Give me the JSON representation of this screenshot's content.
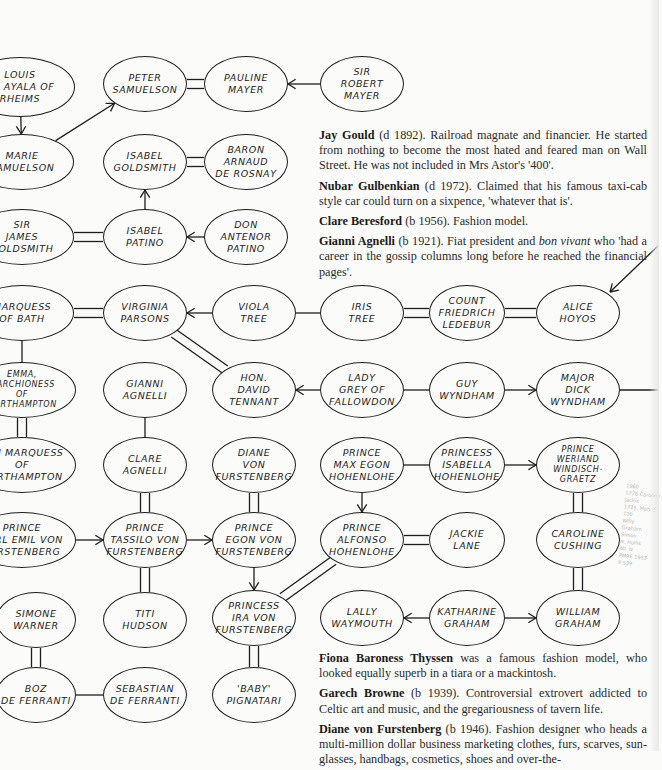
{
  "diagram": {
    "type": "family-relationship-chart",
    "legend_note": "double line = marriage; single line = relationship; arrow = child/descent",
    "nodes": [
      {
        "id": "louis",
        "label": "Louis\nde Ayala of\nRheims",
        "cx": 20,
        "cy": 87,
        "rx": 55,
        "ry": 30
      },
      {
        "id": "peter",
        "label": "Peter\nSamuelson",
        "cx": 145,
        "cy": 84,
        "rx": 42,
        "ry": 28
      },
      {
        "id": "pauline",
        "label": "Pauline\nMayer",
        "cx": 246,
        "cy": 84,
        "rx": 42,
        "ry": 28
      },
      {
        "id": "robert",
        "label": "Sir\nRobert\nMayer",
        "cx": 362,
        "cy": 84,
        "rx": 42,
        "ry": 28
      },
      {
        "id": "marie",
        "label": "Marie\nSamuelson",
        "cx": 22,
        "cy": 162,
        "rx": 52,
        "ry": 28
      },
      {
        "id": "isabelg",
        "label": "Isabel\nGoldsmith",
        "cx": 145,
        "cy": 162,
        "rx": 42,
        "ry": 28
      },
      {
        "id": "baron",
        "label": "Baron\nArnaud\nde Rosnay",
        "cx": 246,
        "cy": 162,
        "rx": 42,
        "ry": 28
      },
      {
        "id": "jamesg",
        "label": "Sir\nJames\nGoldsmith",
        "cx": 22,
        "cy": 237,
        "rx": 52,
        "ry": 28
      },
      {
        "id": "isabelp",
        "label": "Isabel\nPatino",
        "cx": 145,
        "cy": 237,
        "rx": 42,
        "ry": 28
      },
      {
        "id": "antenor",
        "label": "Don\nAntenor\nPatino",
        "cx": 246,
        "cy": 237,
        "rx": 42,
        "ry": 28
      },
      {
        "id": "bath",
        "label": "Marquess\nof Bath",
        "cx": 22,
        "cy": 313,
        "rx": 52,
        "ry": 28
      },
      {
        "id": "virginia",
        "label": "Virginia\nParsons",
        "cx": 145,
        "cy": 313,
        "rx": 42,
        "ry": 28
      },
      {
        "id": "viola",
        "label": "Viola\nTree",
        "cx": 254,
        "cy": 313,
        "rx": 42,
        "ry": 28
      },
      {
        "id": "iris",
        "label": "Iris\nTree",
        "cx": 362,
        "cy": 313,
        "rx": 42,
        "ry": 28
      },
      {
        "id": "friedrich",
        "label": "Count\nFriedrich\nLedebur",
        "cx": 467,
        "cy": 313,
        "rx": 38,
        "ry": 28
      },
      {
        "id": "alice",
        "label": "Alice\nHoyos",
        "cx": 578,
        "cy": 313,
        "rx": 42,
        "ry": 28
      },
      {
        "id": "emma",
        "label": "Emma,\nMarchioness\nof\nNorthampton",
        "cx": 22,
        "cy": 390,
        "rx": 54,
        "ry": 28
      },
      {
        "id": "gianni",
        "label": "Gianni\nAgnelli",
        "cx": 145,
        "cy": 390,
        "rx": 42,
        "ry": 28
      },
      {
        "id": "tennant",
        "label": "Hon.\nDavid\nTennant",
        "cx": 254,
        "cy": 390,
        "rx": 42,
        "ry": 28
      },
      {
        "id": "grey",
        "label": "Lady\nGrey of\nFallowdon",
        "cx": 362,
        "cy": 390,
        "rx": 42,
        "ry": 28
      },
      {
        "id": "guy",
        "label": "Guy\nWyndham",
        "cx": 467,
        "cy": 390,
        "rx": 38,
        "ry": 28
      },
      {
        "id": "dick",
        "label": "Major\nDick\nWyndham",
        "cx": 578,
        "cy": 390,
        "rx": 42,
        "ry": 28
      },
      {
        "id": "marquess6",
        "label": "6th Marquess\nof\nNorthampton",
        "cx": 22,
        "cy": 465,
        "rx": 54,
        "ry": 28
      },
      {
        "id": "clare",
        "label": "Clare\nAgnelli",
        "cx": 145,
        "cy": 465,
        "rx": 42,
        "ry": 28
      },
      {
        "id": "diane",
        "label": "Diane\nvon\nFurstenberg",
        "cx": 254,
        "cy": 465,
        "rx": 42,
        "ry": 28
      },
      {
        "id": "maxegon",
        "label": "Prince\nMax Egon\nHohenlohe",
        "cx": 362,
        "cy": 465,
        "rx": 42,
        "ry": 28
      },
      {
        "id": "isabellah",
        "label": "Princess\nIsabella\nHohenlohe",
        "cx": 467,
        "cy": 465,
        "rx": 38,
        "ry": 28
      },
      {
        "id": "weriand",
        "label": "Prince\nWeriand\nWindisch-\nGraetz",
        "cx": 578,
        "cy": 465,
        "rx": 42,
        "ry": 28
      },
      {
        "id": "karlemil",
        "label": "Prince\nKarl Emil von\nFurstenberg",
        "cx": 22,
        "cy": 540,
        "rx": 54,
        "ry": 28
      },
      {
        "id": "tassilo",
        "label": "Prince\nTassilo von\nFurstenberg",
        "cx": 145,
        "cy": 540,
        "rx": 42,
        "ry": 28
      },
      {
        "id": "egon",
        "label": "Prince\nEgon von\nFurstenberg",
        "cx": 254,
        "cy": 540,
        "rx": 42,
        "ry": 28
      },
      {
        "id": "alfonso",
        "label": "Prince\nAlfonso\nHohenlohe",
        "cx": 362,
        "cy": 540,
        "rx": 42,
        "ry": 28
      },
      {
        "id": "jackie",
        "label": "Jackie\nLane",
        "cx": 467,
        "cy": 540,
        "rx": 38,
        "ry": 28
      },
      {
        "id": "caroline",
        "label": "Caroline\nCushing",
        "cx": 578,
        "cy": 540,
        "rx": 42,
        "ry": 28
      },
      {
        "id": "simone",
        "label": "Simone\nWarner",
        "cx": 36,
        "cy": 620,
        "rx": 40,
        "ry": 28
      },
      {
        "id": "titi",
        "label": "Titi\nHudson",
        "cx": 145,
        "cy": 620,
        "rx": 42,
        "ry": 28
      },
      {
        "id": "ira",
        "label": "Princess\nIra von\nFurstenberg",
        "cx": 254,
        "cy": 618,
        "rx": 42,
        "ry": 28
      },
      {
        "id": "lally",
        "label": "Lally\nWaymouth",
        "cx": 362,
        "cy": 618,
        "rx": 42,
        "ry": 28
      },
      {
        "id": "katharine",
        "label": "Katharine\nGraham",
        "cx": 467,
        "cy": 618,
        "rx": 38,
        "ry": 28
      },
      {
        "id": "william",
        "label": "William\nGraham",
        "cx": 578,
        "cy": 618,
        "rx": 42,
        "ry": 28
      },
      {
        "id": "boz",
        "label": "Boz\nde Ferranti",
        "cx": 36,
        "cy": 695,
        "rx": 40,
        "ry": 28
      },
      {
        "id": "sebastian",
        "label": "Sebastian\nde Ferranti",
        "cx": 145,
        "cy": 695,
        "rx": 42,
        "ry": 28
      },
      {
        "id": "baby",
        "label": "'Baby'\nPignatari",
        "cx": 254,
        "cy": 695,
        "rx": 42,
        "ry": 28
      }
    ],
    "edges": [
      {
        "from": "louis",
        "to": "marie",
        "kind": "arrow"
      },
      {
        "from": "marie",
        "to": "peter",
        "kind": "arrow"
      },
      {
        "from": "peter",
        "to": "pauline",
        "kind": "double"
      },
      {
        "from": "robert",
        "to": "pauline",
        "kind": "arrow"
      },
      {
        "from": "isabelg",
        "to": "baron",
        "kind": "double"
      },
      {
        "from": "isabelp",
        "to": "isabelg",
        "kind": "arrow"
      },
      {
        "from": "jamesg",
        "to": "isabelp",
        "kind": "double"
      },
      {
        "from": "antenor",
        "to": "isabelp",
        "kind": "arrow"
      },
      {
        "from": "bath",
        "to": "virginia",
        "kind": "double"
      },
      {
        "from": "viola",
        "to": "virginia",
        "kind": "arrow"
      },
      {
        "from": "viola",
        "to": "iris",
        "kind": "line"
      },
      {
        "from": "iris",
        "to": "friedrich",
        "kind": "double"
      },
      {
        "from": "friedrich",
        "to": "alice",
        "kind": "double"
      },
      {
        "from": "virginia",
        "to": "tennant",
        "kind": "double"
      },
      {
        "from": "bath",
        "to": "emma",
        "kind": "line"
      },
      {
        "from": "grey",
        "to": "tennant",
        "kind": "arrow"
      },
      {
        "from": "grey",
        "to": "guy",
        "kind": "line"
      },
      {
        "from": "guy",
        "to": "dick",
        "kind": "arrow"
      },
      {
        "from": "emma",
        "to": "marquess6",
        "kind": "double"
      },
      {
        "from": "gianni",
        "to": "clare",
        "kind": "line"
      },
      {
        "from": "clare",
        "to": "tassilo",
        "kind": "double"
      },
      {
        "from": "diane",
        "to": "egon",
        "kind": "double"
      },
      {
        "from": "maxegon",
        "to": "isabellah",
        "kind": "line"
      },
      {
        "from": "isabellah",
        "to": "weriand",
        "kind": "arrow"
      },
      {
        "from": "maxegon",
        "to": "alfonso",
        "kind": "arrow"
      },
      {
        "from": "weriand",
        "to": "caroline",
        "kind": "double"
      },
      {
        "from": "karlemil",
        "to": "tassilo",
        "kind": "arrow"
      },
      {
        "from": "tassilo",
        "to": "egon",
        "kind": "arrow"
      },
      {
        "from": "alfonso",
        "to": "jackie",
        "kind": "double"
      },
      {
        "from": "caroline",
        "to": "william",
        "kind": "double"
      },
      {
        "from": "tassilo",
        "to": "titi",
        "kind": "double"
      },
      {
        "from": "egon",
        "to": "ira",
        "kind": "arrow"
      },
      {
        "from": "alfonso",
        "to": "ira",
        "kind": "double"
      },
      {
        "from": "katharine",
        "to": "lally",
        "kind": "arrow"
      },
      {
        "from": "katharine",
        "to": "william",
        "kind": "arrow"
      },
      {
        "from": "simone",
        "to": "boz",
        "kind": "double"
      },
      {
        "from": "boz",
        "to": "sebastian",
        "kind": "line"
      },
      {
        "from": "ira",
        "to": "baby",
        "kind": "double"
      }
    ],
    "offpage_edges": [
      {
        "x1": 659,
        "y1": 245,
        "x2": 610,
        "y2": 292,
        "kind": "arrow",
        "note": "arrow from off-page into Alice Hoyos"
      },
      {
        "x1": 620,
        "y1": 390,
        "x2": 659,
        "y2": 390,
        "kind": "line",
        "note": "line from Major Dick Wyndham to off-page"
      }
    ]
  },
  "bios_top": [
    {
      "name": "Jay Gould",
      "rest": " (d 1892). Railroad magnate and financier. He started from nothing to become the most hated and feared man on Wall Street. He was not included in Mrs Astor's '400'."
    },
    {
      "name": "Nubar Gulbenkian",
      "rest": " (d 1972). Claimed that his famous taxi-cab style car could turn on a sixpence, 'whatever that is'."
    },
    {
      "name": "Clare Beresford",
      "rest": " (b 1956). Fashion model."
    },
    {
      "name": "Gianni Agnelli",
      "rest": " (b 1921). Fiat president and ",
      "italic": "bon vivant",
      "rest2": " who 'had a career in the gossip columns long before he reached the financial pages'."
    }
  ],
  "bios_bottom": [
    {
      "name": "Fiona Baroness Thyssen",
      "rest": " was a famous fashion model, who looked equally superb in a tiara or a mackintosh."
    },
    {
      "name": "Garech Browne",
      "rest": " (b 1939). Controversial extrovert addicted to Celtic art and music, and the gregariousness of tavern life."
    },
    {
      "name": "Diane von Furstenberg",
      "rest": " (b 1946). Fashion designer who heads a multi-million dollar business marketing clothes, furs, scarves, sun-glasses, handbags, cosmetics, shoes and over-the-"
    }
  ],
  "margin_scribble": "1960\n1776 Caroline\nJackie\n1735, Mph 2\n110\nWilly\nGraham\nSimon\nN. Hollis\nAll. N\nPMRE 1953\nP 539",
  "colors": {
    "ink": "#1d1d1d",
    "paper": "#fbfbf9",
    "text": "#2a2a2a",
    "pencil": "#b8b8b8"
  }
}
